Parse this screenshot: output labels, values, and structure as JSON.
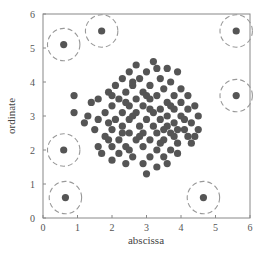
{
  "chart_data": {
    "type": "scatter",
    "title": "",
    "xlabel": "abscissa",
    "ylabel": "ordinate",
    "xlim": [
      0,
      6
    ],
    "ylim": [
      0,
      6
    ],
    "xticks": [
      "0",
      "1",
      "2",
      "3",
      "4",
      "5",
      "6"
    ],
    "yticks": [
      "0",
      "1",
      "2",
      "3",
      "4",
      "5",
      "6"
    ],
    "grid": false,
    "legend": null,
    "colors": {
      "point": "#555555",
      "outlier_ring": "#999999",
      "axis": "#888888",
      "text": "#555555"
    },
    "outliers": [
      {
        "x": 0.6,
        "y": 5.1
      },
      {
        "x": 1.7,
        "y": 5.5
      },
      {
        "x": 5.6,
        "y": 5.5
      },
      {
        "x": 5.6,
        "y": 3.6
      },
      {
        "x": 0.6,
        "y": 2.0
      },
      {
        "x": 0.65,
        "y": 0.6
      },
      {
        "x": 4.65,
        "y": 0.6
      }
    ],
    "outlier_ring_radius": 0.47,
    "cluster": {
      "center": [
        3.0,
        3.0
      ],
      "points": [
        [
          3.2,
          4.6
        ],
        [
          2.7,
          4.5
        ],
        [
          3.6,
          4.4
        ],
        [
          2.5,
          4.3
        ],
        [
          3.0,
          4.3
        ],
        [
          3.9,
          4.3
        ],
        [
          2.3,
          4.1
        ],
        [
          2.8,
          4.1
        ],
        [
          3.4,
          4.1
        ],
        [
          3.7,
          4.0
        ],
        [
          2.1,
          3.9
        ],
        [
          2.6,
          3.9
        ],
        [
          3.1,
          3.9
        ],
        [
          3.5,
          3.8
        ],
        [
          4.0,
          3.8
        ],
        [
          1.9,
          3.7
        ],
        [
          2.4,
          3.7
        ],
        [
          2.9,
          3.7
        ],
        [
          3.3,
          3.6
        ],
        [
          3.8,
          3.6
        ],
        [
          4.2,
          3.6
        ],
        [
          0.9,
          3.6
        ],
        [
          1.6,
          3.5
        ],
        [
          2.2,
          3.5
        ],
        [
          2.7,
          3.5
        ],
        [
          3.1,
          3.5
        ],
        [
          3.6,
          3.4
        ],
        [
          4.0,
          3.4
        ],
        [
          4.4,
          3.3
        ],
        [
          1.4,
          3.4
        ],
        [
          2.0,
          3.3
        ],
        [
          2.5,
          3.3
        ],
        [
          2.9,
          3.3
        ],
        [
          3.4,
          3.2
        ],
        [
          3.8,
          3.2
        ],
        [
          4.2,
          3.2
        ],
        [
          1.8,
          3.1
        ],
        [
          2.3,
          3.1
        ],
        [
          2.7,
          3.1
        ],
        [
          3.2,
          3.1
        ],
        [
          3.6,
          3.0
        ],
        [
          4.0,
          3.0
        ],
        [
          4.5,
          3.0
        ],
        [
          0.9,
          3.1
        ],
        [
          1.3,
          3.0
        ],
        [
          1.6,
          2.9
        ],
        [
          2.1,
          2.9
        ],
        [
          2.5,
          2.9
        ],
        [
          3.0,
          2.9
        ],
        [
          3.4,
          2.9
        ],
        [
          3.8,
          2.8
        ],
        [
          4.3,
          2.8
        ],
        [
          1.9,
          2.8
        ],
        [
          2.3,
          2.7
        ],
        [
          2.8,
          2.7
        ],
        [
          3.2,
          2.7
        ],
        [
          3.6,
          2.7
        ],
        [
          4.1,
          2.6
        ],
        [
          4.5,
          2.6
        ],
        [
          1.2,
          2.8
        ],
        [
          1.5,
          2.6
        ],
        [
          2.0,
          2.6
        ],
        [
          2.5,
          2.5
        ],
        [
          2.9,
          2.5
        ],
        [
          3.3,
          2.5
        ],
        [
          3.7,
          2.5
        ],
        [
          4.2,
          2.4
        ],
        [
          1.8,
          2.4
        ],
        [
          2.2,
          2.3
        ],
        [
          2.7,
          2.3
        ],
        [
          3.1,
          2.3
        ],
        [
          3.5,
          2.3
        ],
        [
          3.9,
          2.2
        ],
        [
          4.3,
          2.2
        ],
        [
          1.6,
          2.1
        ],
        [
          2.0,
          2.1
        ],
        [
          2.4,
          2.1
        ],
        [
          2.9,
          2.1
        ],
        [
          3.3,
          2.0
        ],
        [
          3.7,
          2.0
        ],
        [
          2.2,
          1.9
        ],
        [
          2.6,
          1.8
        ],
        [
          3.1,
          1.8
        ],
        [
          3.5,
          1.8
        ],
        [
          3.9,
          1.9
        ],
        [
          1.7,
          1.9
        ],
        [
          2.4,
          1.6
        ],
        [
          2.9,
          1.6
        ],
        [
          3.3,
          1.5
        ],
        [
          3.0,
          1.3
        ],
        [
          2.0,
          1.7
        ],
        [
          3.6,
          1.6
        ],
        [
          2.6,
          4.0
        ],
        [
          3.3,
          4.4
        ],
        [
          2.0,
          3.6
        ],
        [
          3.0,
          3.6
        ],
        [
          2.4,
          3.4
        ],
        [
          3.7,
          3.3
        ],
        [
          4.1,
          2.9
        ],
        [
          2.6,
          3.0
        ],
        [
          3.1,
          3.2
        ],
        [
          3.5,
          2.6
        ],
        [
          2.8,
          2.4
        ],
        [
          3.9,
          2.6
        ],
        [
          2.3,
          2.5
        ],
        [
          3.4,
          2.2
        ],
        [
          1.9,
          2.3
        ],
        [
          4.4,
          2.4
        ],
        [
          2.5,
          2.0
        ],
        [
          3.8,
          2.4
        ]
      ]
    }
  }
}
